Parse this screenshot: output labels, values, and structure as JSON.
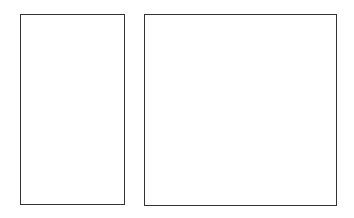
{
  "diagram": {
    "shapes": [
      {
        "id": "left-rectangle",
        "type": "rectangle",
        "label": "",
        "stroke": "#333333",
        "fill": "#ffffff"
      },
      {
        "id": "right-rectangle",
        "type": "rectangle",
        "label": "",
        "stroke": "#333333",
        "fill": "#ffffff"
      }
    ]
  }
}
